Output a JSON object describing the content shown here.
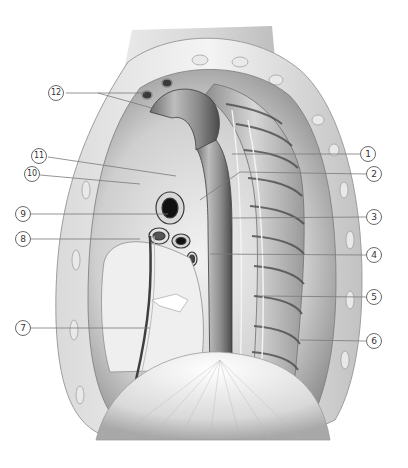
{
  "figure": {
    "style": "grayscale anatomical illustration",
    "colors": {
      "background": "#ffffff",
      "leader_line": "#7a7a7a",
      "callout_border": "#6a6a6a",
      "callout_text": "#333333"
    }
  },
  "callouts": [
    {
      "n": "1",
      "x": 368,
      "y": 154,
      "side": "right",
      "line_from": [
        232,
        154
      ]
    },
    {
      "n": "2",
      "x": 374,
      "y": 174,
      "side": "right",
      "line_from": [
        240,
        172
      ]
    },
    {
      "n": "3",
      "x": 374,
      "y": 217,
      "side": "right",
      "line_from": [
        232,
        218
      ]
    },
    {
      "n": "4",
      "x": 374,
      "y": 255,
      "side": "right",
      "line_from": [
        210,
        254
      ]
    },
    {
      "n": "5",
      "x": 374,
      "y": 297,
      "side": "right",
      "line_from": [
        262,
        296
      ]
    },
    {
      "n": "6",
      "x": 374,
      "y": 341,
      "side": "right",
      "line_from": [
        300,
        340
      ]
    },
    {
      "n": "7",
      "x": 23,
      "y": 328,
      "side": "left",
      "line_from": [
        150,
        328
      ]
    },
    {
      "n": "8",
      "x": 23,
      "y": 239,
      "side": "left",
      "line_from": [
        140,
        239
      ]
    },
    {
      "n": "9",
      "x": 23,
      "y": 214,
      "side": "left",
      "line_from": [
        168,
        214
      ]
    },
    {
      "n": "10",
      "x": 32,
      "y": 174,
      "side": "left",
      "line_from": [
        140,
        184
      ]
    },
    {
      "n": "11",
      "x": 39,
      "y": 156,
      "side": "left",
      "line_from": [
        176,
        176
      ]
    },
    {
      "n": "12",
      "x": 56,
      "y": 93,
      "side": "left",
      "line_from": [
        145,
        93
      ],
      "line_from_2": [
        152,
        108
      ]
    }
  ],
  "callout_labels": {
    "c1": "1",
    "c2": "2",
    "c3": "3",
    "c4": "4",
    "c5": "5",
    "c6": "6",
    "c7": "7",
    "c8": "8",
    "c9": "9",
    "c10": "10",
    "c11": "11",
    "c12": "12"
  }
}
